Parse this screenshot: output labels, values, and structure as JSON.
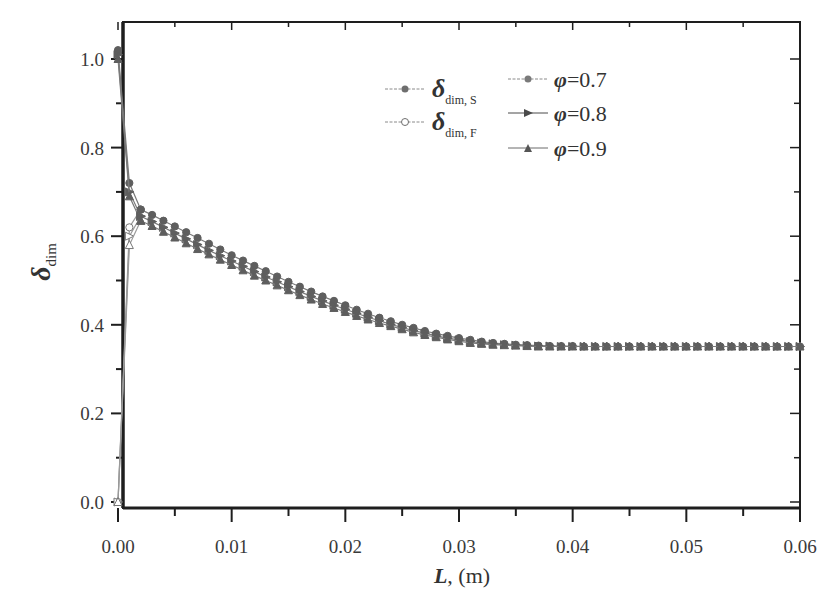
{
  "chart_data": {
    "type": "line",
    "title": "",
    "xlabel": "L, (m)",
    "xlabel_main": "L",
    "xlabel_unit": ", (m)",
    "ylabel": "δ_dim",
    "ylabel_main": "δ",
    "ylabel_sub": "dim",
    "xlim": [
      0.0,
      0.06
    ],
    "ylim": [
      0.0,
      1.05
    ],
    "x_ticks": [
      "0.00",
      "0.01",
      "0.02",
      "0.03",
      "0.04",
      "0.05",
      "0.06"
    ],
    "y_ticks": [
      "0.0",
      "0.2",
      "0.4",
      "0.6",
      "0.8",
      "1.0"
    ],
    "grid": false,
    "legend": {
      "position": "upper-center",
      "type_entries": [
        {
          "symbol": "δ",
          "sub": "dim, S",
          "marker": "filled-circle",
          "label": "δ_dim, S"
        },
        {
          "symbol": "δ",
          "sub": "dim, F",
          "marker": "open-circle",
          "label": "δ_dim, F"
        }
      ],
      "phi_entries": [
        {
          "symbol": "φ",
          "value": "=0.7",
          "marker": "circle",
          "label": "φ=0.7"
        },
        {
          "symbol": "φ",
          "value": "=0.8",
          "marker": "right-triangle",
          "label": "φ=0.8"
        },
        {
          "symbol": "φ",
          "value": "=0.9",
          "marker": "up-triangle",
          "label": "φ=0.9"
        }
      ]
    },
    "x_step": 0.001,
    "series": [
      {
        "name": "δ_dim,S φ=0.7",
        "marker": "circle",
        "filled": true,
        "x": [
          0.0,
          0.001,
          0.002
        ],
        "values": [
          1.02,
          0.72,
          0.66
        ]
      },
      {
        "name": "δ_dim,S φ=0.8",
        "marker": "right-triangle",
        "filled": true,
        "x": [
          0.0,
          0.001,
          0.002
        ],
        "values": [
          1.01,
          0.7,
          0.645
        ]
      },
      {
        "name": "δ_dim,S φ=0.9",
        "marker": "up-triangle",
        "filled": true,
        "x": [
          0.0,
          0.001,
          0.002
        ],
        "values": [
          1.0,
          0.69,
          0.635
        ]
      },
      {
        "name": "δ_dim,F φ=0.7",
        "marker": "circle",
        "filled": false,
        "x": [
          0.0,
          0.001,
          0.002
        ],
        "values": [
          0.0,
          0.62,
          0.66
        ]
      },
      {
        "name": "δ_dim,F φ=0.8",
        "marker": "right-triangle",
        "filled": false,
        "x": [
          0.0,
          0.001,
          0.002
        ],
        "values": [
          0.0,
          0.6,
          0.645
        ]
      },
      {
        "name": "δ_dim,F φ=0.9",
        "marker": "up-triangle",
        "filled": false,
        "x": [
          0.0,
          0.001,
          0.002
        ],
        "values": [
          0.0,
          0.58,
          0.635
        ]
      },
      {
        "name": "φ=0.7 (merged)",
        "marker": "circle",
        "filled": true,
        "x": [
          0.002,
          0.003,
          0.004,
          0.005,
          0.006,
          0.007,
          0.008,
          0.009,
          0.01,
          0.011,
          0.012,
          0.013,
          0.014,
          0.015,
          0.016,
          0.017,
          0.018,
          0.019,
          0.02,
          0.021,
          0.022,
          0.023,
          0.024,
          0.025,
          0.026,
          0.027,
          0.028,
          0.029,
          0.03,
          0.031,
          0.032,
          0.033,
          0.034,
          0.035,
          0.036,
          0.037,
          0.038,
          0.039,
          0.04,
          0.041,
          0.042,
          0.043,
          0.044,
          0.045,
          0.046,
          0.047,
          0.048,
          0.049,
          0.05,
          0.051,
          0.052,
          0.053,
          0.054,
          0.055,
          0.056,
          0.057,
          0.058,
          0.059,
          0.06
        ],
        "values": [
          0.66,
          0.648,
          0.635,
          0.622,
          0.609,
          0.596,
          0.583,
          0.57,
          0.557,
          0.545,
          0.533,
          0.521,
          0.509,
          0.497,
          0.486,
          0.475,
          0.464,
          0.454,
          0.444,
          0.434,
          0.425,
          0.416,
          0.408,
          0.4,
          0.393,
          0.386,
          0.38,
          0.375,
          0.37,
          0.366,
          0.362,
          0.359,
          0.357,
          0.355,
          0.354,
          0.353,
          0.352,
          0.352,
          0.352,
          0.351,
          0.351,
          0.351,
          0.351,
          0.351,
          0.351,
          0.351,
          0.351,
          0.351,
          0.351,
          0.351,
          0.351,
          0.351,
          0.351,
          0.351,
          0.351,
          0.351,
          0.351,
          0.351,
          0.351
        ]
      },
      {
        "name": "φ=0.8 (merged)",
        "marker": "right-triangle",
        "filled": true,
        "x": [
          0.002,
          0.003,
          0.004,
          0.005,
          0.006,
          0.007,
          0.008,
          0.009,
          0.01,
          0.011,
          0.012,
          0.013,
          0.014,
          0.015,
          0.016,
          0.017,
          0.018,
          0.019,
          0.02,
          0.021,
          0.022,
          0.023,
          0.024,
          0.025,
          0.026,
          0.027,
          0.028,
          0.029,
          0.03,
          0.031,
          0.032,
          0.033,
          0.034,
          0.035,
          0.036,
          0.037,
          0.038,
          0.039,
          0.04,
          0.041,
          0.042,
          0.043,
          0.044,
          0.045,
          0.046,
          0.047,
          0.048,
          0.049,
          0.05,
          0.051,
          0.052,
          0.053,
          0.054,
          0.055,
          0.056,
          0.057,
          0.058,
          0.059,
          0.06
        ],
        "values": [
          0.645,
          0.633,
          0.62,
          0.607,
          0.594,
          0.581,
          0.568,
          0.556,
          0.544,
          0.532,
          0.52,
          0.508,
          0.497,
          0.486,
          0.475,
          0.464,
          0.454,
          0.444,
          0.435,
          0.426,
          0.417,
          0.409,
          0.401,
          0.394,
          0.387,
          0.381,
          0.375,
          0.37,
          0.366,
          0.362,
          0.359,
          0.357,
          0.355,
          0.354,
          0.353,
          0.352,
          0.352,
          0.351,
          0.351,
          0.351,
          0.351,
          0.351,
          0.351,
          0.351,
          0.351,
          0.351,
          0.351,
          0.351,
          0.351,
          0.351,
          0.351,
          0.351,
          0.351,
          0.351,
          0.351,
          0.351,
          0.351,
          0.351,
          0.351
        ]
      },
      {
        "name": "φ=0.9 (merged)",
        "marker": "up-triangle",
        "filled": true,
        "x": [
          0.002,
          0.003,
          0.004,
          0.005,
          0.006,
          0.007,
          0.008,
          0.009,
          0.01,
          0.011,
          0.012,
          0.013,
          0.014,
          0.015,
          0.016,
          0.017,
          0.018,
          0.019,
          0.02,
          0.021,
          0.022,
          0.023,
          0.024,
          0.025,
          0.026,
          0.027,
          0.028,
          0.029,
          0.03,
          0.031,
          0.032,
          0.033,
          0.034,
          0.035,
          0.036,
          0.037,
          0.038,
          0.039,
          0.04,
          0.041,
          0.042,
          0.043,
          0.044,
          0.045,
          0.046,
          0.047,
          0.048,
          0.049,
          0.05,
          0.051,
          0.052,
          0.053,
          0.054,
          0.055,
          0.056,
          0.057,
          0.058,
          0.059,
          0.06
        ],
        "values": [
          0.635,
          0.623,
          0.61,
          0.597,
          0.584,
          0.571,
          0.559,
          0.547,
          0.535,
          0.523,
          0.511,
          0.5,
          0.489,
          0.478,
          0.467,
          0.457,
          0.447,
          0.438,
          0.429,
          0.42,
          0.412,
          0.404,
          0.397,
          0.39,
          0.383,
          0.377,
          0.372,
          0.367,
          0.363,
          0.359,
          0.357,
          0.355,
          0.354,
          0.353,
          0.352,
          0.351,
          0.351,
          0.351,
          0.351,
          0.351,
          0.351,
          0.351,
          0.351,
          0.351,
          0.351,
          0.351,
          0.351,
          0.351,
          0.351,
          0.351,
          0.351,
          0.351,
          0.351,
          0.351,
          0.351,
          0.351,
          0.351,
          0.351,
          0.351
        ]
      }
    ]
  },
  "colors": {
    "axis": "#1e1e1e",
    "line": "#8a8a8a",
    "marker": "#6e6e6e",
    "text": "#3a3a3a"
  }
}
